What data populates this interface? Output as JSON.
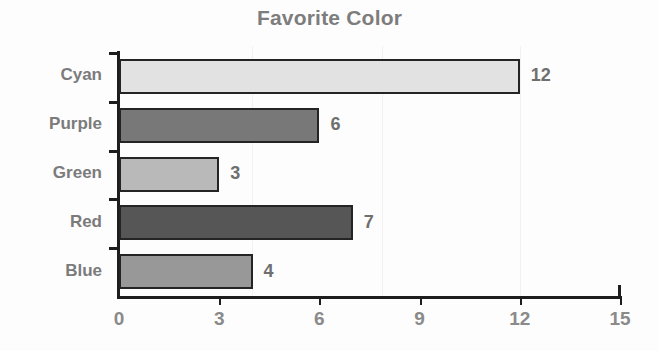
{
  "chart_data": {
    "type": "bar",
    "orientation": "horizontal",
    "title": "Favorite Color",
    "xlabel": "",
    "ylabel": "",
    "categories": [
      "Cyan",
      "Purple",
      "Green",
      "Red",
      "Blue"
    ],
    "values": [
      12,
      6,
      3,
      7,
      4
    ],
    "data_labels": [
      "12",
      "6",
      "3",
      "7",
      "4"
    ],
    "bar_fills": [
      "#e2e2e2",
      "#787878",
      "#b9b9b9",
      "#565656",
      "#989898"
    ],
    "bar_border_color": "#242424",
    "xlim": [
      0,
      15
    ],
    "x_ticks": [
      0,
      3,
      6,
      9,
      12,
      15
    ],
    "x_tick_labels": [
      "0",
      "3",
      "6",
      "9",
      "12",
      "15"
    ],
    "grid": false,
    "legend": false,
    "title_color": "#7d7d7d",
    "axis_color": "#1d1d1d",
    "label_color": "#7b7b7b"
  }
}
